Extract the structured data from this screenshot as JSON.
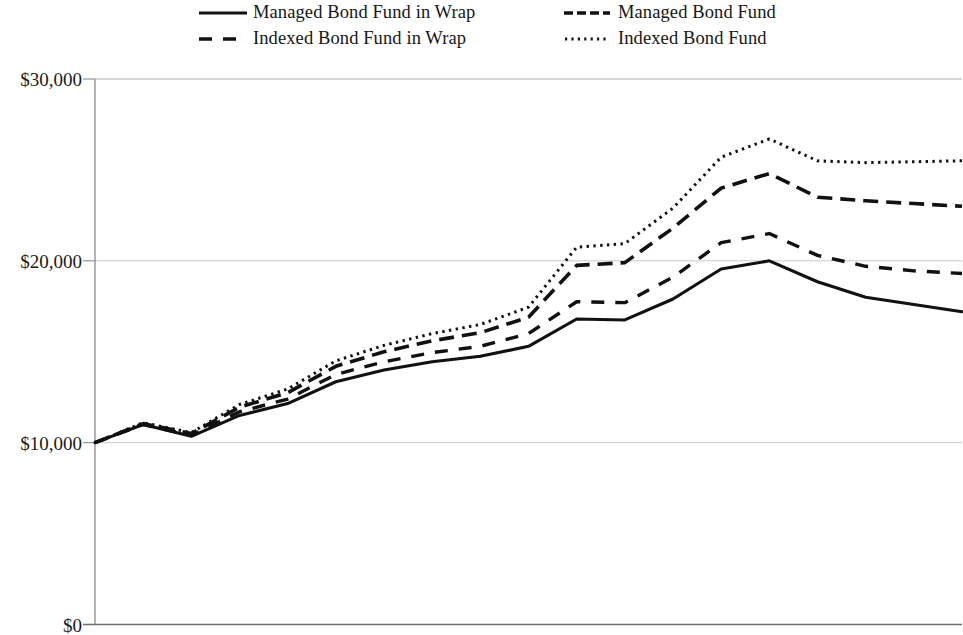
{
  "chart_data": {
    "type": "line",
    "title": "",
    "subtitle": "",
    "xlabel": "",
    "ylabel": "",
    "ylim": [
      0,
      30000
    ],
    "y_ticks": [
      0,
      10000,
      20000,
      30000
    ],
    "y_tick_labels": [
      "$0",
      "$10,000",
      "$20,000",
      "$30,000"
    ],
    "x_tick_labels": [],
    "grid": "horizontal",
    "legend_position": "top",
    "x_count": 19,
    "x": [
      0,
      1,
      2,
      3,
      4,
      5,
      6,
      7,
      8,
      9,
      10,
      11,
      12,
      13,
      14,
      15,
      16,
      17,
      18
    ],
    "series": [
      {
        "name": "Managed Bond Fund in Wrap",
        "style": "solid",
        "color": "#111111",
        "values": [
          10000,
          11000,
          10350,
          11500,
          12150,
          13350,
          14000,
          14450,
          14750,
          15300,
          16800,
          16750,
          17900,
          19550,
          20000,
          18850,
          18000,
          17600,
          17200
        ]
      },
      {
        "name": "Indexed Bond Fund in Wrap",
        "style": "dashed",
        "color": "#111111",
        "values": [
          10000,
          11000,
          10400,
          11700,
          12400,
          13750,
          14450,
          14950,
          15300,
          16000,
          17750,
          17700,
          19100,
          21000,
          21500,
          20300,
          19700,
          19450,
          19300
        ]
      },
      {
        "name": "Managed Bond Fund",
        "style": "long-dashed",
        "color": "#111111",
        "values": [
          10000,
          11050,
          10500,
          11950,
          12750,
          14200,
          15000,
          15600,
          16050,
          16900,
          19750,
          19900,
          21800,
          24000,
          24800,
          23500,
          23300,
          23150,
          23000
        ]
      },
      {
        "name": "Indexed Bond Fund",
        "style": "dotted",
        "color": "#111111",
        "values": [
          10000,
          11100,
          10550,
          12100,
          12950,
          14500,
          15350,
          16000,
          16500,
          17450,
          20750,
          20950,
          22900,
          25700,
          26700,
          25500,
          25400,
          25450,
          25500
        ]
      }
    ]
  },
  "legend": {
    "items": [
      {
        "label": "Managed Bond Fund in Wrap",
        "style": "solid"
      },
      {
        "label": "Managed Bond Fund",
        "style": "long-dashed"
      },
      {
        "label": "Indexed Bond Fund in Wrap",
        "style": "dashed"
      },
      {
        "label": "Indexed Bond Fund",
        "style": "dotted"
      }
    ]
  },
  "axis": {
    "colors": {
      "axis_line": "#8b8b8b",
      "gridline": "#c9c9c9",
      "series": "#111111"
    }
  }
}
